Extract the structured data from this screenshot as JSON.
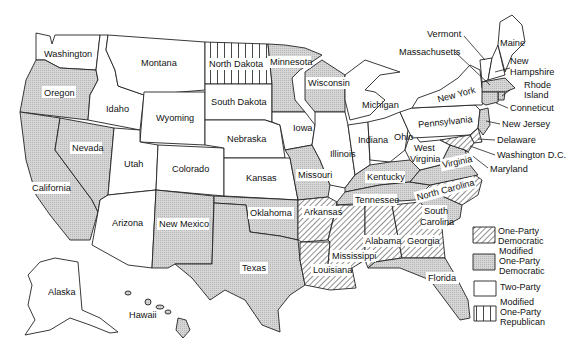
{
  "legend": {
    "items": [
      {
        "key": "one-party-democratic",
        "line1": "One-Party",
        "line2": "Democratic",
        "line3": ""
      },
      {
        "key": "modified-one-party-democratic",
        "line1": "Modified",
        "line2": "One-Party",
        "line3": "Democratic"
      },
      {
        "key": "two-party",
        "line1": "Two-Party",
        "line2": "",
        "line3": ""
      },
      {
        "key": "modified-one-party-republican",
        "line1": "Modified",
        "line2": "One-Party",
        "line3": "Republican"
      }
    ]
  },
  "states": {
    "washington": {
      "label": "Washington",
      "category": "two-party"
    },
    "oregon": {
      "label": "Oregon",
      "category": "modified-one-party-democratic"
    },
    "california": {
      "label": "California",
      "category": "modified-one-party-democratic"
    },
    "nevada": {
      "label": "Nevada",
      "category": "modified-one-party-democratic"
    },
    "idaho": {
      "label": "Idaho",
      "category": "two-party"
    },
    "montana": {
      "label": "Montana",
      "category": "two-party"
    },
    "wyoming": {
      "label": "Wyoming",
      "category": "two-party"
    },
    "utah": {
      "label": "Utah",
      "category": "two-party"
    },
    "colorado": {
      "label": "Colorado",
      "category": "two-party"
    },
    "arizona": {
      "label": "Arizona",
      "category": "two-party"
    },
    "new_mexico": {
      "label": "New Mexico",
      "category": "modified-one-party-democratic"
    },
    "north_dakota": {
      "label": "North Dakota",
      "category": "modified-one-party-republican"
    },
    "south_dakota": {
      "label": "South Dakota",
      "category": "two-party"
    },
    "nebraska": {
      "label": "Nebraska",
      "category": "two-party"
    },
    "kansas": {
      "label": "Kansas",
      "category": "two-party"
    },
    "oklahoma": {
      "label": "Oklahoma",
      "category": "modified-one-party-democratic"
    },
    "texas": {
      "label": "Texas",
      "category": "modified-one-party-democratic"
    },
    "minnesota": {
      "label": "Minnesota",
      "category": "modified-one-party-democratic"
    },
    "iowa": {
      "label": "Iowa",
      "category": "two-party"
    },
    "missouri": {
      "label": "Missouri",
      "category": "modified-one-party-democratic"
    },
    "arkansas": {
      "label": "Arkansas",
      "category": "one-party-democratic"
    },
    "louisiana": {
      "label": "Louisiana",
      "category": "one-party-democratic"
    },
    "wisconsin": {
      "label": "Wisconsin",
      "category": "modified-one-party-democratic"
    },
    "illinois": {
      "label": "Illinois",
      "category": "two-party"
    },
    "michigan": {
      "label": "Michigan",
      "category": "two-party"
    },
    "indiana": {
      "label": "Indiana",
      "category": "two-party"
    },
    "ohio": {
      "label": "Ohio",
      "category": "two-party"
    },
    "kentucky": {
      "label": "Kentucky",
      "category": "modified-one-party-democratic"
    },
    "tennessee": {
      "label": "Tennessee",
      "category": "modified-one-party-democratic"
    },
    "mississippi": {
      "label": "Mississippi",
      "category": "one-party-democratic"
    },
    "alabama": {
      "label": "Alabama",
      "category": "one-party-democratic"
    },
    "georgia": {
      "label": "Georgia",
      "category": "one-party-democratic"
    },
    "florida": {
      "label": "Florida",
      "category": "modified-one-party-democratic"
    },
    "south_carolina": {
      "label_line1": "South",
      "label_line2": "Carolina",
      "category": "modified-one-party-democratic"
    },
    "north_carolina": {
      "label": "North Carolina",
      "category": "one-party-democratic"
    },
    "virginia": {
      "label": "Virginia",
      "category": "modified-one-party-democratic"
    },
    "west_virginia": {
      "label_line1": "West",
      "label_line2": "Virginia",
      "category": "two-party"
    },
    "pennsylvania": {
      "label": "Pennsylvania",
      "category": "two-party"
    },
    "new_york": {
      "label": "New York",
      "category": "two-party"
    },
    "vermont": {
      "label": "Vermont",
      "category": "two-party"
    },
    "new_hampshire": {
      "label_line1": "New",
      "label_line2": "Hampshire",
      "category": "two-party"
    },
    "maine": {
      "label": "Maine",
      "category": "two-party"
    },
    "massachusetts": {
      "label": "Massachusetts",
      "category": "modified-one-party-democratic"
    },
    "rhode_island": {
      "label_line1": "Rhode",
      "label_line2": "Island",
      "category": "modified-one-party-democratic"
    },
    "connecticut": {
      "label": "Conneticut",
      "category": "modified-one-party-democratic"
    },
    "new_jersey": {
      "label": "New Jersey",
      "category": "modified-one-party-democratic"
    },
    "delaware": {
      "label": "Delaware",
      "category": "one-party-democratic"
    },
    "maryland": {
      "label": "Maryland",
      "category": "one-party-democratic"
    },
    "washington_dc": {
      "label": "Washington D.C.",
      "category": "one-party-democratic"
    },
    "alaska": {
      "label": "Alaska",
      "category": "two-party"
    },
    "hawaii": {
      "label": "Hawaii",
      "category": "modified-one-party-democratic"
    }
  }
}
